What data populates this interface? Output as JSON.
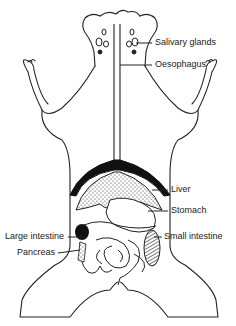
{
  "diagram": {
    "labels": [
      {
        "id": "salivary",
        "text": "Salivary glands"
      },
      {
        "id": "oesophagus",
        "text": "Oesophagus"
      },
      {
        "id": "liver",
        "text": "Liver"
      },
      {
        "id": "stomach",
        "text": "Stomach"
      },
      {
        "id": "large_intestine",
        "text": "Large intestine"
      },
      {
        "id": "small_intestine",
        "text": "Small intestine"
      },
      {
        "id": "pancreas",
        "text": "Pancreas"
      }
    ],
    "colors": {
      "line": "#222222",
      "background": "#ffffff",
      "fill_dark": "#111111"
    }
  }
}
